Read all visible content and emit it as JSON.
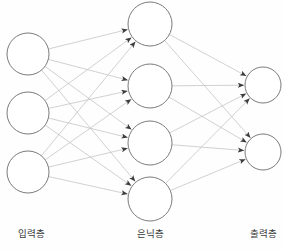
{
  "diagram": {
    "type": "neural-network",
    "title": "",
    "background_color": "#fefefe",
    "node_stroke_color": "#7b7b7b",
    "node_fill_color": "#ffffff",
    "edge_color": "#bdbdbd",
    "arrowhead_color": "#3b3b3b",
    "label_color": "#3a3a3a",
    "layers": [
      {
        "id": "input",
        "label": "입력층",
        "label_x": 31,
        "label_y": 237,
        "node_count": 3,
        "radius": 21,
        "cx": 28,
        "node_cy": [
          54,
          113,
          172
        ]
      },
      {
        "id": "hidden",
        "label": "은닉층",
        "label_x": 150,
        "label_y": 237,
        "node_count": 4,
        "radius": 22,
        "cx": 150,
        "node_cy": [
          24,
          86,
          143,
          199
        ]
      },
      {
        "id": "output",
        "label": "출력층",
        "label_x": 263,
        "label_y": 237,
        "node_count": 2,
        "radius": 18,
        "cx": 263,
        "node_cy": [
          85,
          152
        ]
      }
    ],
    "connections": [
      {
        "from_layer": "input",
        "to_layer": "hidden",
        "fully_connected": true,
        "edge_count": 12,
        "directed": true
      },
      {
        "from_layer": "hidden",
        "to_layer": "output",
        "fully_connected": true,
        "edge_count": 8,
        "directed": true
      }
    ]
  }
}
